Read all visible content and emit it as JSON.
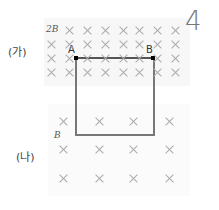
{
  "problem_number": "4",
  "panels": {
    "top": {
      "label": "(가)",
      "field_label": "2B"
    },
    "bottom": {
      "label": "(나)",
      "field_label": "B"
    }
  },
  "points": {
    "a": "A",
    "b": "B"
  },
  "field_symbol": "×",
  "grid_top": {
    "rows_y": [
      30,
      44,
      58,
      72
    ],
    "cols_x": [
      51,
      69,
      87,
      105,
      123,
      139,
      157,
      175
    ]
  },
  "grid_bottom": {
    "rows_y": [
      121,
      149,
      178
    ],
    "cols_x": [
      63,
      99,
      133,
      169
    ]
  },
  "colors": {
    "loop": "#777777",
    "field_marks": "#aaaaaa",
    "region_bg": "#f7f7f7"
  }
}
